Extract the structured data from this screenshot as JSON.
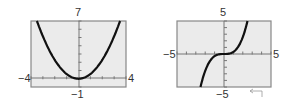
{
  "chart_data": [
    {
      "type": "line",
      "title": "",
      "function": "parabola with vertex at (0,0)",
      "xlim": [
        -4,
        4
      ],
      "ylim": [
        -1,
        7
      ],
      "xscl": 1,
      "yscl": 1,
      "x": [
        -3.5,
        -3,
        -2,
        -1,
        0,
        1,
        2,
        3,
        3.5
      ],
      "y": [
        7,
        5.1,
        2.3,
        0.6,
        0,
        0.6,
        2.3,
        5.1,
        7
      ],
      "labels": {
        "xmin": "−4",
        "xmax": "4",
        "ymin": "−1",
        "ymax": "7"
      },
      "grid": false,
      "background": "#ebebeb",
      "line_color": "#111111"
    },
    {
      "type": "line",
      "title": "",
      "function": "cubic-like with flat inflection at origin",
      "xlim": [
        -5,
        5
      ],
      "ylim": [
        -5,
        5
      ],
      "xscl": 1,
      "yscl": 1,
      "x": [
        -2.5,
        -2,
        -1.5,
        -1,
        -0.5,
        0,
        0.5,
        1,
        1.5,
        2,
        2.5
      ],
      "y": [
        -5,
        -3.5,
        -1.6,
        -0.4,
        -0.05,
        0,
        0.05,
        0.4,
        1.6,
        3.5,
        5
      ],
      "labels": {
        "xmin": "−5",
        "xmax": "5",
        "ymin": "−5",
        "ymax": "5"
      },
      "grid": false,
      "background": "#ebebeb",
      "line_color": "#111111"
    }
  ]
}
